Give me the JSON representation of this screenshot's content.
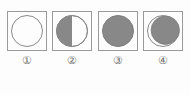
{
  "figure": {
    "background_color": "#fdfdfd",
    "frame_border_color": "#9a9a9a",
    "disk_outline_color": "#8a8a8a",
    "shadow_fill_color": "#888888",
    "lit_fill_color": "#fdfdfd",
    "label_color": "#6f6f6f"
  },
  "panels": [
    {
      "id": "panel-1",
      "label": "①",
      "phase_name": "full-unshaded-circle",
      "description": "Open circle with no shading",
      "shaded_fraction": 0.0,
      "shaded_side": "none"
    },
    {
      "id": "panel-2",
      "label": "②",
      "phase_name": "half-shaded-left",
      "description": "Circle with left half shaded gray, right half white",
      "shaded_fraction": 0.5,
      "shaded_side": "left"
    },
    {
      "id": "panel-3",
      "label": "③",
      "phase_name": "fully-shaded-circle",
      "description": "Circle completely filled gray",
      "shaded_fraction": 1.0,
      "shaded_side": "all"
    },
    {
      "id": "panel-4",
      "label": "④",
      "phase_name": "gibbous-shaded-thin-left-crescent",
      "description": "Circle almost fully gray with a thin white crescent along the left edge",
      "shaded_fraction": 0.9,
      "shaded_side": "right-majority"
    }
  ]
}
